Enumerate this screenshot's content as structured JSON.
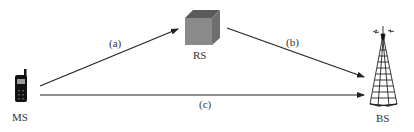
{
  "diagram": {
    "nodes": [
      {
        "id": "MS",
        "label": "MS",
        "icon": "mobile-phone-icon"
      },
      {
        "id": "RS",
        "label": "RS",
        "icon": "relay-cube-icon"
      },
      {
        "id": "BS",
        "label": "BS",
        "icon": "cell-tower-icon"
      }
    ],
    "edges": [
      {
        "id": "a",
        "from": "MS",
        "to": "RS",
        "label": "(a)"
      },
      {
        "id": "b",
        "from": "RS",
        "to": "BS",
        "label": "(b)"
      },
      {
        "id": "c",
        "from": "MS",
        "to": "BS",
        "label": "(c)"
      }
    ],
    "colors": {
      "line": "#222222",
      "cube_front": "#8a8a8a",
      "cube_top": "#5a5a5a",
      "cube_side": "#6e6e6e",
      "phone": "#111111"
    }
  }
}
